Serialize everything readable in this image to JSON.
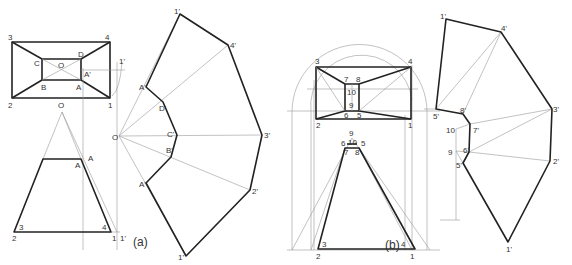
{
  "figure": {
    "caption_a": "(a)",
    "caption_b": "(b)",
    "colors": {
      "line": "#222222",
      "construction": "#999999",
      "background": "#ffffff"
    }
  },
  "part_a": {
    "top_view_labels": {
      "p3": "3",
      "p4": "4",
      "p2": "2",
      "p1": "1",
      "C": "C",
      "D": "D",
      "O": "O",
      "B": "B",
      "A": "A",
      "A_prime": "A'",
      "one_prime_top": "1'"
    },
    "front_view_labels": {
      "O": "O",
      "A_upper": "A",
      "A_lower": "A",
      "p3": "3",
      "p4": "4",
      "p2": "2",
      "p1": "1",
      "one_prime": "1'"
    },
    "development_labels": {
      "O": "O",
      "p1_top": "1'",
      "p4": "4'",
      "p3": "3'",
      "p2": "2'",
      "p1_bottom": "1'",
      "A_top": "A'",
      "D": "D'",
      "C": "C'",
      "B": "B'",
      "A_bottom": "A'"
    }
  },
  "part_b": {
    "top_view_labels": {
      "p3": "3",
      "p4": "4",
      "p2": "2",
      "p1": "1",
      "p7": "7",
      "p8": "8",
      "p10": "10",
      "p9": "9",
      "p6": "6",
      "p5": "5"
    },
    "front_view_labels": {
      "p9": "9",
      "p10": "10",
      "p6": "6",
      "p5": "5",
      "p7": "7",
      "p8": "8",
      "p3": "3",
      "p4": "4",
      "p2": "2",
      "p1": "1"
    },
    "development_labels": {
      "p1_top": "1'",
      "p4": "4'",
      "p5_upper": "5'",
      "p8": "8'",
      "p10": "10",
      "p7": "7'",
      "p3": "3'",
      "p9": "9",
      "p6": "6'",
      "p5_lower": "5'",
      "p2": "2'",
      "p1_bottom": "1'"
    }
  }
}
